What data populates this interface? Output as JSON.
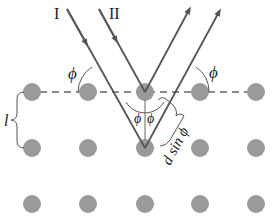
{
  "diagram": {
    "rays": {
      "ray1_label": "I",
      "ray2_label": "II"
    },
    "angle_label": "ϕ",
    "spacing_label": "l",
    "path_difference_label": "d sin ϕ",
    "colors": {
      "atom": "#9a9a9a",
      "ray": "#555555",
      "dashed_plane": "#666666",
      "text": "#222222"
    },
    "lattice": {
      "columns_x": [
        32,
        88,
        145,
        200,
        256
      ],
      "rows_y": [
        92,
        148,
        204
      ],
      "atom_radius": 9
    }
  }
}
